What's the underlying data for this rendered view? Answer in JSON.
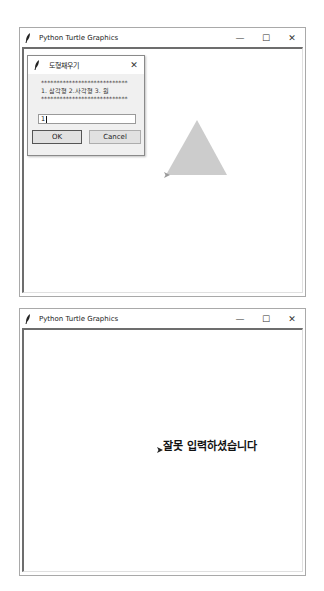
{
  "windows": [
    {
      "title": "Python Turtle Graphics",
      "controls": {
        "minimize": "—",
        "maximize": "☐",
        "close": "✕"
      },
      "dialog": {
        "title": "도형채우기",
        "close": "✕",
        "prompt_line1": "****************************",
        "prompt_line2": "1. 삼각형 2.사각형 3. 원",
        "prompt_line3": "****************************",
        "input_value": "1",
        "ok_label": "OK",
        "cancel_label": "Cancel"
      },
      "canvas": {
        "shape": "triangle",
        "fill_color": "#cccccc",
        "turtle": "arrow"
      }
    },
    {
      "title": "Python Turtle Graphics",
      "controls": {
        "minimize": "—",
        "maximize": "☐",
        "close": "✕"
      },
      "canvas": {
        "message": "잘못 입력하셨습니다",
        "turtle": "arrow"
      }
    }
  ]
}
